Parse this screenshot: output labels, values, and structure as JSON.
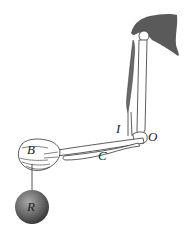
{
  "diagram": {
    "type": "anatomical lever diagram (arm/forearm)",
    "labels": {
      "insertion": "I",
      "fulcrum": "O",
      "lever_arm": "C",
      "hand": "B",
      "resistance": "R"
    },
    "parts": [
      "scapula",
      "humerus",
      "biceps-muscle",
      "radius",
      "ulna",
      "hand",
      "string",
      "weight-ball"
    ],
    "colors": {
      "scapula": "#5a5a5a",
      "muscle": "#6a6a6a",
      "bone_outline": "#333333",
      "ball_light": "#9a9a9a",
      "ball_dark": "#3a3a3a"
    }
  }
}
